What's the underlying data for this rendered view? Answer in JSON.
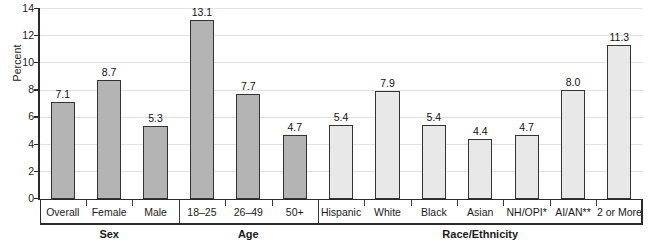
{
  "chart_data": {
    "type": "bar",
    "title": "",
    "subtitle": "",
    "xlabel": "",
    "ylabel": "Percent",
    "ylim": [
      0,
      14
    ],
    "yticks": [
      0,
      2,
      4,
      6,
      8,
      10,
      12,
      14
    ],
    "ytick_labels": [
      "0",
      "2",
      "4",
      "6",
      "8",
      "10",
      "12",
      "14"
    ],
    "grid": true,
    "legend": "none",
    "categories": [
      "Overall",
      "Female",
      "Male",
      "18–25",
      "26–49",
      "50+",
      "Hispanic",
      "White",
      "Black",
      "Asian",
      "NH/OPI*",
      "AI/AN**",
      "2 or More"
    ],
    "values": [
      7.1,
      8.7,
      5.3,
      13.1,
      7.7,
      4.7,
      5.4,
      7.9,
      5.4,
      4.4,
      4.7,
      8.0,
      11.3
    ],
    "value_labels": [
      "7.1",
      "8.7",
      "5.3",
      "13.1",
      "7.7",
      "4.7",
      "5.4",
      "7.9",
      "5.4",
      "4.4",
      "4.7",
      "8.0",
      "11.3"
    ],
    "bar_fills": [
      "dark",
      "dark",
      "dark",
      "dark",
      "dark",
      "dark",
      "light",
      "light",
      "light",
      "light",
      "light",
      "light",
      "light"
    ],
    "groups": [
      {
        "label": "Sex",
        "start": 0,
        "end": 2
      },
      {
        "label": "Age",
        "start": 3,
        "end": 5
      },
      {
        "label": "Race/Ethnicity",
        "start": 6,
        "end": 12
      }
    ],
    "colors": {
      "bar_dark_fill": "#b4b4b4",
      "bar_light_fill": "#e8e8e8",
      "bar_outline": "#333333",
      "axis": "#2b2b2b",
      "gridline": "#e2e2e2",
      "text": "#1a1a1a",
      "background": "#ffffff"
    }
  }
}
